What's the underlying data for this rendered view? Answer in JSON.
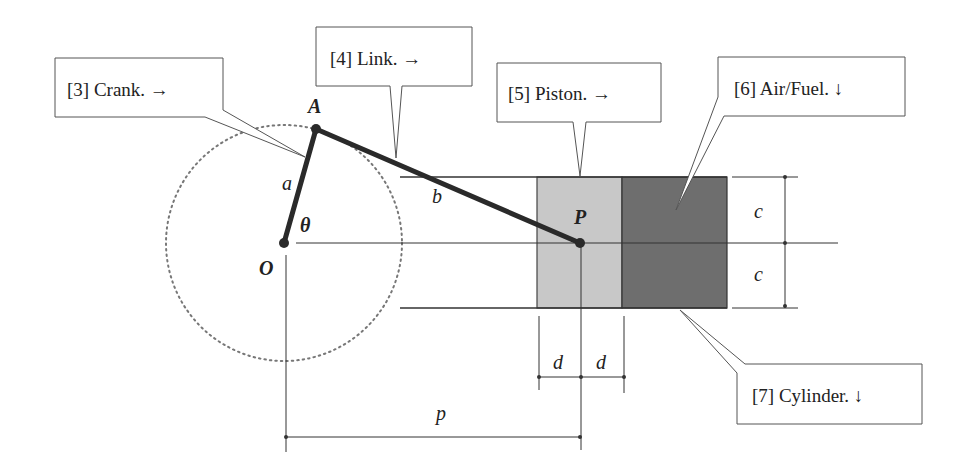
{
  "diagram": {
    "type": "slider-crank mechanism",
    "callouts": [
      {
        "id": "crank",
        "label": "[3] Crank.  →"
      },
      {
        "id": "link",
        "label": "[4] Link.  →"
      },
      {
        "id": "piston",
        "label": "[5] Piston.  →"
      },
      {
        "id": "airfuel",
        "label": "[6] Air/Fuel.  ↓"
      },
      {
        "id": "cylinder",
        "label": "[7] Cylinder.  ↓"
      }
    ],
    "points": {
      "O": "O",
      "A": "A",
      "P": "P"
    },
    "variables": {
      "a": "a",
      "b": "b",
      "theta": "θ",
      "c_top": "c",
      "c_bottom": "c",
      "d_left": "d",
      "d_right": "d",
      "p": "p"
    },
    "colors": {
      "piston_fill": "#c8c8c8",
      "airfuel_fill": "#707070",
      "line": "#333333",
      "link_bar": "#2a2a2a"
    }
  }
}
